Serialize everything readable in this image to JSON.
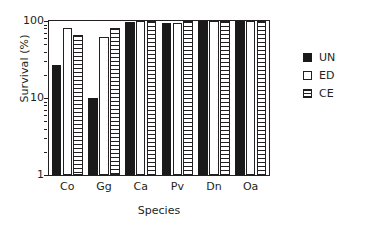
{
  "chart_data": {
    "type": "bar",
    "title": "",
    "subtitle": "",
    "xlabel": "Species",
    "ylabel": "Survival (%)",
    "categories": [
      "Co",
      "Gg",
      "Ca",
      "Pv",
      "Dn",
      "Oa"
    ],
    "series": [
      {
        "name": "UN",
        "fill": "solid-black",
        "values": [
          27,
          10,
          96,
          95,
          99,
          99
        ]
      },
      {
        "name": "ED",
        "fill": "white-open",
        "values": [
          80,
          62,
          99,
          95,
          99,
          99
        ]
      },
      {
        "name": "CE",
        "fill": "horizontal-hatch",
        "values": [
          65,
          82,
          99,
          99,
          99,
          99
        ]
      }
    ],
    "yscale": "log",
    "ylim": [
      1,
      100
    ],
    "ytick_labels": [
      "100",
      "10",
      "1"
    ],
    "ytick_values": [
      100,
      10,
      1
    ],
    "yminor_ticks": [
      90,
      80,
      70,
      60,
      50,
      40,
      30,
      20,
      9,
      8,
      7,
      6,
      5,
      4,
      3,
      2
    ],
    "grid": false,
    "legend": {
      "position": "right",
      "entries": [
        {
          "label": "UN",
          "swatch": "solid-black"
        },
        {
          "label": "ED",
          "swatch": "white-open"
        },
        {
          "label": "CE",
          "swatch": "horizontal-hatch"
        }
      ]
    },
    "colors": {
      "foreground": "#231f20",
      "bar_solid": "#1a1a1a",
      "bar_open": "#ffffff",
      "background": "#ffffff"
    }
  }
}
